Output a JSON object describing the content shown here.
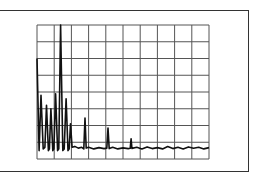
{
  "chart_data": {
    "type": "line",
    "title": "",
    "xlabel": "",
    "ylabel": "",
    "grid": true,
    "grid_divisions": {
      "x": 10,
      "y": 8
    },
    "xlim": [
      0,
      10
    ],
    "ylim": [
      0,
      8
    ],
    "noise_floor": 0.65,
    "peaks": [
      {
        "x": 0.0,
        "y": 6.0
      },
      {
        "x": 0.23,
        "y": 3.8
      },
      {
        "x": 0.55,
        "y": 3.2
      },
      {
        "x": 0.81,
        "y": 3.0
      },
      {
        "x": 1.08,
        "y": 3.9
      },
      {
        "x": 1.37,
        "y": 8.0
      },
      {
        "x": 1.69,
        "y": 3.6
      },
      {
        "x": 1.95,
        "y": 2.1
      },
      {
        "x": 2.79,
        "y": 2.45
      },
      {
        "x": 4.13,
        "y": 1.85
      },
      {
        "x": 5.47,
        "y": 1.2
      }
    ],
    "series": [
      {
        "name": "spectrum",
        "x": [
          0.0,
          0.12,
          0.23,
          0.36,
          0.46,
          0.55,
          0.66,
          0.72,
          0.81,
          0.92,
          0.98,
          1.08,
          1.2,
          1.27,
          1.37,
          1.5,
          1.58,
          1.69,
          1.8,
          1.87,
          1.95,
          2.04,
          2.2,
          2.4,
          2.6,
          2.72,
          2.79,
          2.86,
          3.0,
          3.3,
          3.6,
          3.9,
          4.06,
          4.13,
          4.2,
          4.4,
          4.7,
          5.0,
          5.3,
          5.42,
          5.47,
          5.52,
          5.8,
          6.1,
          6.4,
          6.7,
          7.0,
          7.3,
          7.6,
          7.9,
          8.2,
          8.5,
          8.8,
          9.1,
          9.4,
          9.7,
          10.0
        ],
        "values": [
          6.0,
          0.5,
          3.8,
          0.6,
          0.7,
          3.2,
          0.5,
          0.6,
          3.0,
          0.5,
          0.6,
          3.9,
          0.5,
          0.6,
          8.0,
          0.5,
          0.6,
          3.6,
          0.5,
          0.6,
          2.1,
          0.7,
          0.75,
          0.65,
          0.7,
          0.6,
          2.45,
          0.65,
          0.7,
          0.6,
          0.68,
          0.62,
          0.65,
          1.85,
          0.62,
          0.7,
          0.6,
          0.66,
          0.62,
          0.64,
          1.2,
          0.63,
          0.7,
          0.6,
          0.72,
          0.62,
          0.68,
          0.6,
          0.74,
          0.62,
          0.7,
          0.6,
          0.72,
          0.64,
          0.7,
          0.6,
          0.68
        ]
      }
    ]
  },
  "colors": {
    "frame": "#333333",
    "grid": "#555555",
    "trace": "#111111",
    "background": "#ffffff"
  }
}
